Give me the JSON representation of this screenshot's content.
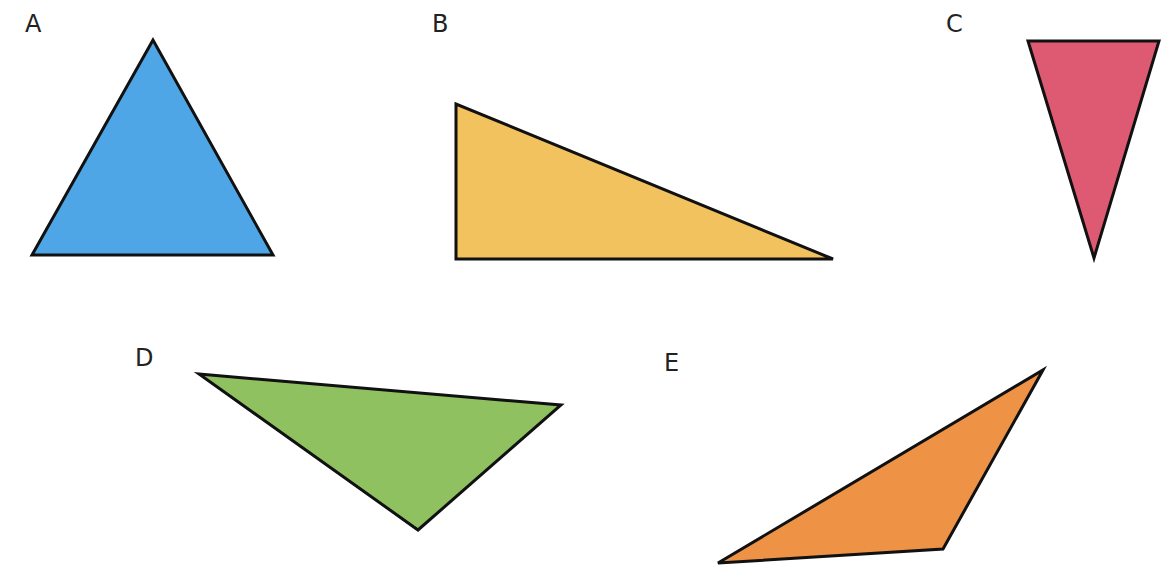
{
  "stroke_color": "#111111",
  "shapes": [
    {
      "id": "A",
      "label": "A",
      "type": "equilateral",
      "fill": "#4fa6e6",
      "points": "153,40 32,255 273,255",
      "label_pos": [
        25,
        12
      ]
    },
    {
      "id": "B",
      "label": "B",
      "type": "right",
      "fill": "#f2c25e",
      "points": "456,104 456,259 833,259",
      "label_pos": [
        432,
        12
      ]
    },
    {
      "id": "C",
      "label": "C",
      "type": "isosceles (inverted)",
      "fill": "#de5a72",
      "points": "1028,41 1159,41 1094,258",
      "label_pos": [
        946,
        12
      ]
    },
    {
      "id": "D",
      "label": "D",
      "type": "scalene (obtuse)",
      "fill": "#8fc160",
      "points": "199,374 561,405 418,530",
      "label_pos": [
        135,
        346
      ]
    },
    {
      "id": "E",
      "label": "E",
      "type": "scalene (obtuse)",
      "fill": "#ee9346",
      "points": "1043,370 943,549 718,563",
      "label_pos": [
        664,
        351
      ]
    }
  ]
}
